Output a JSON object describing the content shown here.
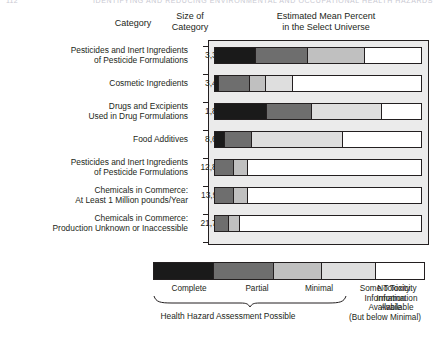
{
  "running_header": {
    "left": "112",
    "right": "IDENTIFYING AND REDUCING ENVIRONMENTAL AND OCCUPATIONAL HEALTH HAZARDS"
  },
  "headers": {
    "category": "Category",
    "size_of_category": "Size of\nCategory",
    "size_line1": "Size of",
    "size_line2": "Category",
    "estimate_line1": "Estimated Mean Percent",
    "estimate_line2": "in the Select Universe"
  },
  "chart_data": {
    "type": "bar",
    "orientation": "horizontal",
    "stacked": true,
    "title": "Estimated Mean Percent in the Select Universe",
    "xlabel": "Estimated Mean Percent in the Select Universe",
    "ylabel": "Category",
    "xlim": [
      0,
      100
    ],
    "grid": false,
    "legend_position": "bottom",
    "categories": [
      "Pesticides and Inert Ingredients of Pesticide Formulations",
      "Cosmetic Ingredients",
      "Drugs and Excipients Used in Drug Formulations",
      "Food Additives",
      "Pesticides and Inert Ingredients of Pesticide Formulations",
      "Chemicals in Commerce: At Least 1 Million pounds/Year",
      "Chemicals in Commerce: Production Unknown or Inaccessible"
    ],
    "category_sizes": [
      "3,350",
      "3,410",
      "1,815",
      "8,627",
      "12,860",
      "13,911",
      "21,752"
    ],
    "series": [
      {
        "name": "Complete",
        "color": "#1a1a1a",
        "values": [
          20,
          2,
          25,
          5,
          0,
          0,
          0
        ]
      },
      {
        "name": "Partial",
        "color": "#6e6e6e",
        "values": [
          25,
          15,
          22,
          13,
          9,
          9,
          7
        ]
      },
      {
        "name": "Minimal",
        "color": "#c0c0c0",
        "values": [
          28,
          8,
          0,
          0,
          7,
          7,
          5
        ]
      },
      {
        "name": "Some Toxicity Information Available (But below Minimal)",
        "color": "#dedede",
        "values": [
          0,
          13,
          34,
          44,
          0,
          0,
          0
        ]
      },
      {
        "name": "No Toxicity Information Available",
        "color": "#ffffff",
        "values": [
          27,
          62,
          19,
          38,
          84,
          84,
          88
        ]
      }
    ]
  },
  "rows": [
    {
      "label_line1": "Pesticides and Inert Ingredients",
      "label_line2": "of Pesticide Formulations",
      "size": "3,350"
    },
    {
      "label_line1": "Cosmetic Ingredients",
      "label_line2": "",
      "size": "3,410"
    },
    {
      "label_line1": "Drugs and Excipients",
      "label_line2": "Used in Drug Formulations",
      "size": "1,815"
    },
    {
      "label_line1": "Food Additives",
      "label_line2": "",
      "size": "8,627"
    },
    {
      "label_line1": "Pesticides and Inert Ingredients",
      "label_line2": "of Pesticide Formulations",
      "size": "12,860"
    },
    {
      "label_line1": "Chemicals in Commerce:",
      "label_line2": "At Least 1 Million pounds/Year",
      "size": "13,911"
    },
    {
      "label_line1": "Chemicals in Commerce:",
      "label_line2": "Production Unknown or Inaccessible",
      "size": "21,752"
    }
  ],
  "legend": {
    "swatch_colors": [
      "#1a1a1a",
      "#6e6e6e",
      "#c0c0c0",
      "#dedede",
      "#ffffff"
    ],
    "items": [
      {
        "label": "Complete"
      },
      {
        "label": "Partial"
      },
      {
        "label": "Minimal"
      },
      {
        "label_line1": "Some Toxicity",
        "label_line2": "Information",
        "label_line3": "Available",
        "label_line4": "(But below Minimal)"
      },
      {
        "label_line1": "No Toxicity",
        "label_line2": "Information",
        "label_line3": "Available"
      }
    ],
    "bracket_caption": "Health Hazard Assessment Possible"
  }
}
